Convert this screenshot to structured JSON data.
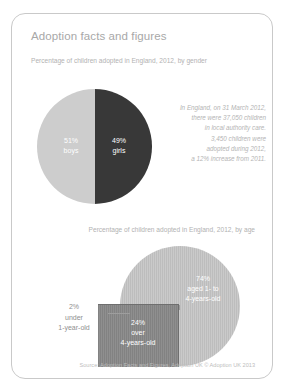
{
  "card": {
    "title": "Adoption facts and figures",
    "source": "Source: Adoption Facts and Figures, Adoption UK © Adoption UK 2013"
  },
  "gender_section": {
    "subtitle": "Percentage of children adopted in England, 2012, by gender",
    "boys_pct": "51%",
    "boys_label": "boys",
    "girls_pct": "49%",
    "girls_label": "girls"
  },
  "fact_box": {
    "line1": "In England, on 31 March 2012,",
    "line2": "there were 37,050 children",
    "line3": "in local authority care.",
    "line4": "3,450 children were",
    "line5": "adopted during 2012,",
    "line6": "a 12% increase from 2011."
  },
  "age_section": {
    "subtitle": "Percentage of children adopted in England, 2012, by age",
    "under1_pct": "2%",
    "under1_line1": "under",
    "under1_line2": "1-year-old",
    "mid_pct": "74%",
    "mid_line1": "aged 1- to",
    "mid_line2": "4-years-old",
    "over4_pct": "24%",
    "over4_line1": "over",
    "over4_line2": "4-years-old"
  },
  "colors": {
    "light_slice": "#cdcdcd",
    "dark_slice": "#383838",
    "striped_light": "#c4c4c4",
    "striped_dark": "#888888",
    "card_border": "#c9c9c9",
    "text_muted": "#b2b2b2"
  },
  "chart_data": [
    {
      "type": "pie",
      "title": "Percentage of children adopted in England, 2012, by gender",
      "categories": [
        "boys",
        "girls"
      ],
      "values": [
        51,
        49
      ],
      "unit": "percent",
      "colors": [
        "#cdcdcd",
        "#383838"
      ],
      "legend": "inline-labels"
    },
    {
      "type": "pie",
      "title": "Percentage of children adopted in England, 2012, by age",
      "categories": [
        "under 1-year-old",
        "aged 1- to 4-years-old",
        "over 4-years-old"
      ],
      "values": [
        2,
        74,
        24
      ],
      "unit": "percent",
      "colors": [
        "#9c9c9c",
        "#c4c4c4",
        "#888888"
      ],
      "legend": "inline-labels-and-callout"
    }
  ]
}
